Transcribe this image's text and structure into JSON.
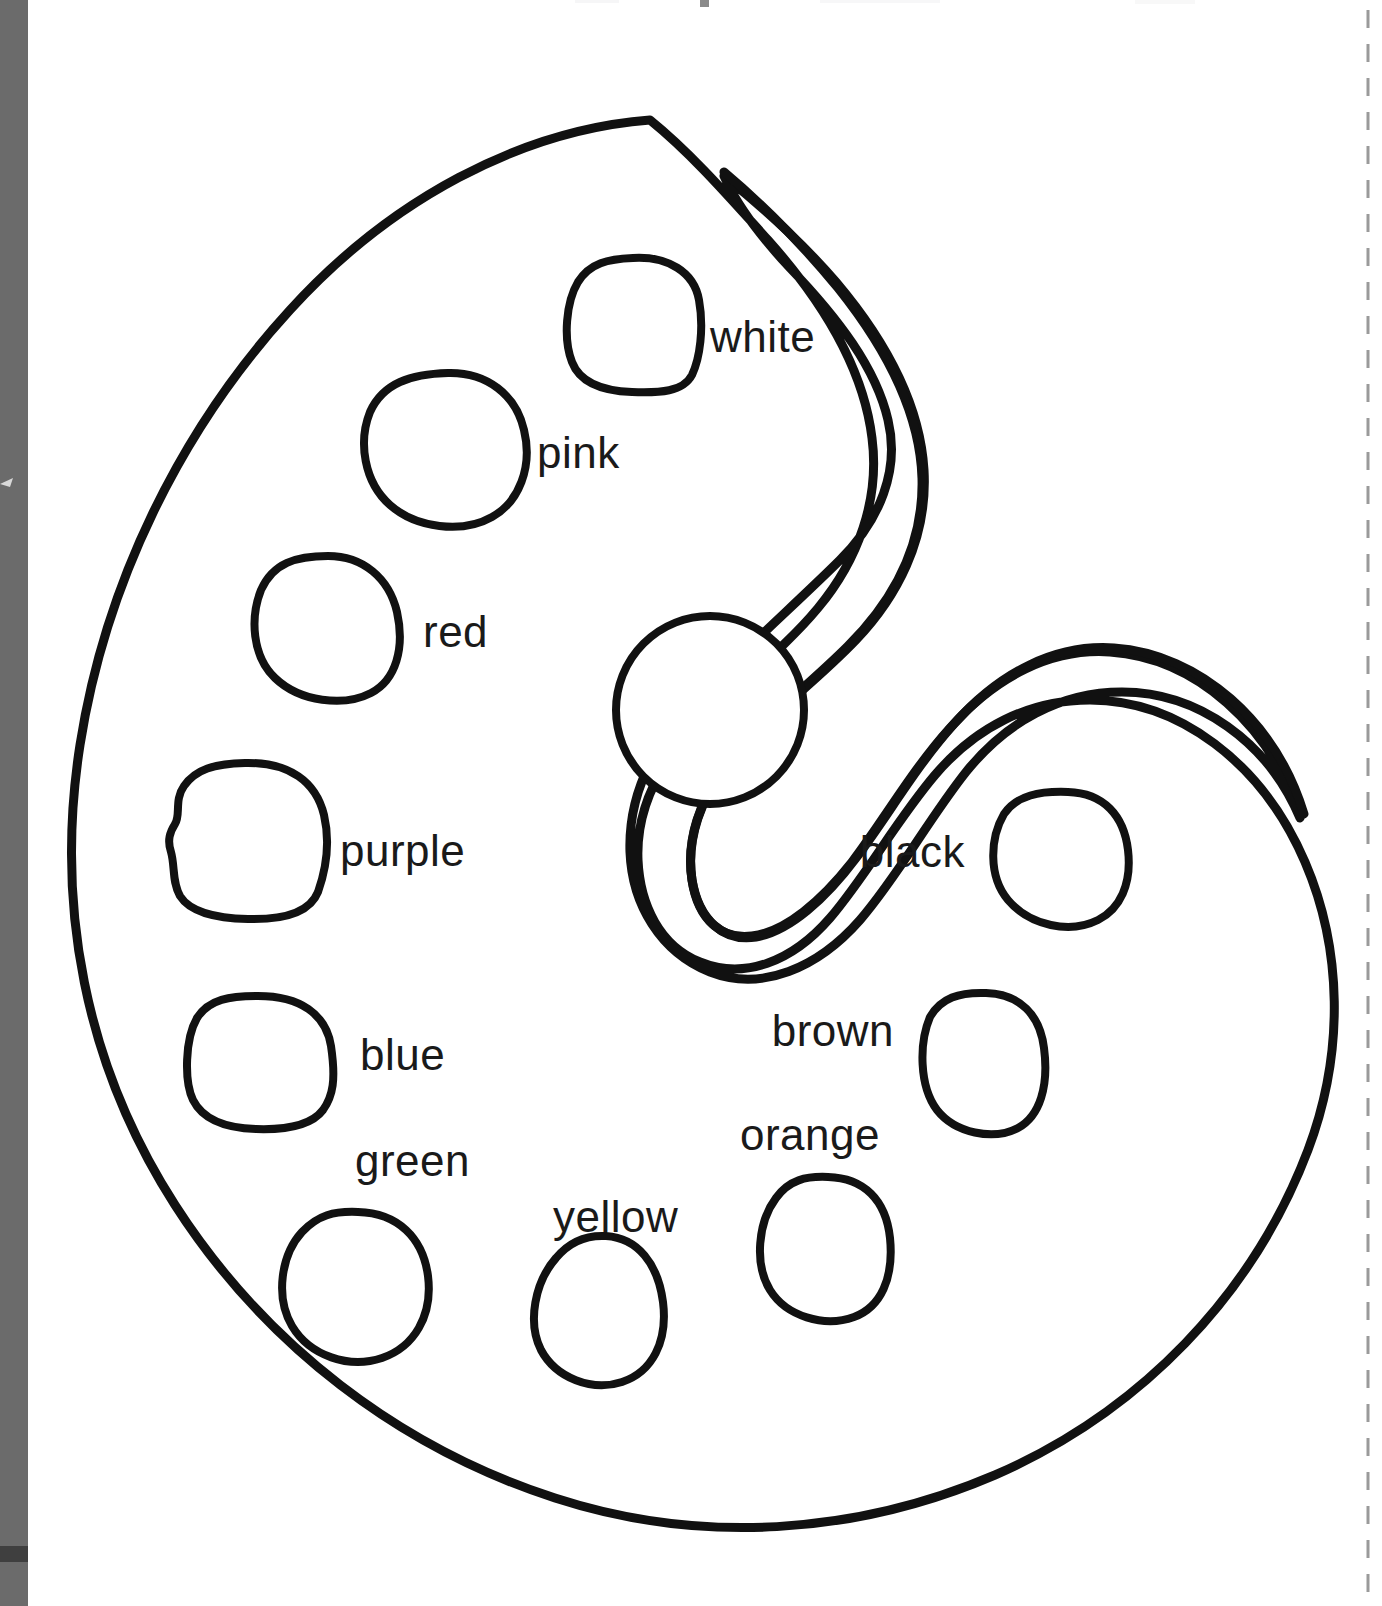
{
  "page": {
    "width": 1382,
    "height": 1606,
    "background_color": "#ffffff",
    "ink_color": "#111111",
    "label_color": "#1a1a1a"
  },
  "scan_artifacts": {
    "left_gutter": {
      "name": "scanner-edge-gutter",
      "color": "#6b6b6b",
      "width_px": 28
    },
    "left_gutter_band": {
      "color": "#3f3f3f"
    },
    "right_trim_line": {
      "name": "dashed-trim-guide",
      "color": "#9a9a9a",
      "style": "dashed-vertical",
      "x_px": 1368
    },
    "top_cropped_text": ""
  },
  "palette": {
    "name": "artist-palette",
    "thumb_hole_present": true,
    "center_well_labeled": false,
    "well_count": 11
  },
  "labels": [
    {
      "id": "white",
      "text": "white",
      "x": 710,
      "y": 352,
      "anchor": "start"
    },
    {
      "id": "pink",
      "text": "pink",
      "x": 537,
      "y": 468,
      "anchor": "start"
    },
    {
      "id": "red",
      "text": "red",
      "x": 423,
      "y": 647,
      "anchor": "start"
    },
    {
      "id": "purple",
      "text": "purple",
      "x": 340,
      "y": 866,
      "anchor": "start"
    },
    {
      "id": "black",
      "text": "black",
      "x": 965,
      "y": 867,
      "anchor": "end"
    },
    {
      "id": "blue",
      "text": "blue",
      "x": 360,
      "y": 1070,
      "anchor": "start"
    },
    {
      "id": "brown",
      "text": "brown",
      "x": 894,
      "y": 1046,
      "anchor": "end"
    },
    {
      "id": "green",
      "text": "green",
      "x": 355,
      "y": 1176,
      "anchor": "start"
    },
    {
      "id": "orange",
      "text": "orange",
      "x": 880,
      "y": 1150,
      "anchor": "end"
    },
    {
      "id": "yellow",
      "text": "yellow",
      "x": 553,
      "y": 1232,
      "anchor": "start"
    }
  ],
  "wells": [
    {
      "id": "white-well",
      "label": "white",
      "cx": 633,
      "cy": 325
    },
    {
      "id": "pink-well",
      "label": "pink",
      "cx": 443,
      "cy": 448
    },
    {
      "id": "red-well",
      "label": "red",
      "cx": 326,
      "cy": 622
    },
    {
      "id": "purple-well",
      "label": "purple",
      "cx": 248,
      "cy": 845
    },
    {
      "id": "center-well",
      "label": "",
      "cx": 710,
      "cy": 710
    },
    {
      "id": "black-well",
      "label": "black",
      "cx": 1063,
      "cy": 852
    },
    {
      "id": "blue-well",
      "label": "blue",
      "cx": 258,
      "cy": 1054
    },
    {
      "id": "brown-well",
      "label": "brown",
      "cx": 983,
      "cy": 1058
    },
    {
      "id": "green-well",
      "label": "green",
      "cx": 361,
      "cy": 1283
    },
    {
      "id": "orange-well",
      "label": "orange",
      "cx": 827,
      "cy": 1243
    },
    {
      "id": "yellow-well",
      "label": "yellow",
      "cx": 601,
      "cy": 1304
    }
  ],
  "color_words": [
    "white",
    "pink",
    "red",
    "purple",
    "black",
    "blue",
    "brown",
    "green",
    "orange",
    "yellow"
  ]
}
